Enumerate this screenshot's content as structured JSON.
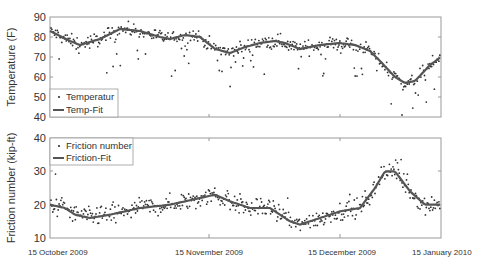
{
  "chart_data": [
    {
      "type": "scatter+line",
      "title": "",
      "ylabel": "Temperature (F)",
      "xlabel": "",
      "ylim": [
        40,
        90
      ],
      "yticks": [
        40,
        50,
        60,
        70,
        80,
        90
      ],
      "legend": [
        "Temperatur",
        "Temp-Fit"
      ],
      "legend_position": "lower-left",
      "x_pixels": [
        50,
        70,
        80,
        100,
        120,
        140,
        160,
        170,
        185,
        200,
        215,
        230,
        245,
        260,
        275,
        285,
        300,
        320,
        340,
        355,
        370,
        380,
        395,
        405,
        415,
        430,
        441
      ],
      "series": [
        {
          "name": "Temp-Fit",
          "kind": "line",
          "values": [
            83,
            78,
            76,
            79,
            84,
            83,
            80,
            79,
            81,
            80,
            74,
            72,
            75,
            77,
            78,
            77,
            74,
            76,
            77,
            76,
            73,
            68,
            60,
            57,
            58,
            66,
            70
          ]
        },
        {
          "name": "Temperatur",
          "kind": "scatter",
          "note": "daily observations scattered around fit, range approx 42-89 F"
        }
      ]
    },
    {
      "type": "scatter+line",
      "title": "",
      "ylabel": "Friction number (kip-ft)",
      "xlabel": "",
      "ylim": [
        10,
        40
      ],
      "yticks": [
        10,
        20,
        30,
        40
      ],
      "legend": [
        "Friction number",
        "Friction-Fit"
      ],
      "legend_position": "upper-left",
      "x_pixels": [
        50,
        65,
        75,
        90,
        110,
        140,
        170,
        200,
        215,
        230,
        250,
        270,
        290,
        300,
        320,
        340,
        360,
        375,
        385,
        395,
        410,
        425,
        441
      ],
      "series": [
        {
          "name": "Friction-Fit",
          "kind": "line",
          "values": [
            20,
            19,
            17,
            16,
            17,
            19,
            20,
            22,
            23,
            21,
            19,
            19,
            15,
            14,
            16,
            18,
            19,
            25,
            30,
            30,
            24,
            20,
            20
          ]
        },
        {
          "name": "Friction number",
          "kind": "scatter",
          "note": "observations scattered around fit, range approx 10-39 kip-ft"
        }
      ]
    }
  ],
  "x_axis": {
    "tick_labels": [
      "15 October 2009",
      "15 November  2009",
      "15 December 2009",
      "15 January 2010"
    ]
  },
  "panels": {
    "top": {
      "ylabel": "Temperature (F)",
      "yticks": [
        "90",
        "80",
        "70",
        "60",
        "50",
        "40"
      ],
      "legend_scatter": "Temperatur",
      "legend_line": "Temp-Fit"
    },
    "bottom": {
      "ylabel": "Friction number (kip-ft)",
      "yticks": [
        "40",
        "30",
        "20",
        "10"
      ],
      "legend_scatter": "Friction number",
      "legend_line": "Friction-Fit"
    }
  },
  "colors": {
    "fit_line": "#555555",
    "points": "#333333",
    "frame": "#888888"
  }
}
